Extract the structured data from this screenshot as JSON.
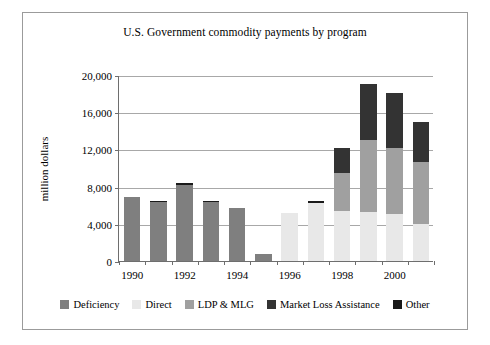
{
  "chart_data": {
    "type": "bar",
    "stacked": true,
    "title": "U.S. Government commodity payments by program",
    "xlabel": "",
    "ylabel": "million dollars",
    "ylim": [
      0,
      20000
    ],
    "ytick_step": 4000,
    "ytick_labels": [
      "20,000",
      "16,000",
      "12,000",
      "8,000",
      "4,000",
      "0"
    ],
    "ytick_values": [
      20000,
      16000,
      12000,
      8000,
      4000,
      0
    ],
    "grid": "horizontal",
    "legend_position": "bottom",
    "categories": [
      1990,
      1991,
      1992,
      1993,
      1994,
      1995,
      1996,
      1997,
      1998,
      1999,
      2000,
      2001
    ],
    "xtick_labels": [
      "1990",
      "1992",
      "1994",
      "1996",
      "1998",
      "2000"
    ],
    "xtick_label_years": [
      1990,
      1992,
      1994,
      1996,
      1998,
      2000
    ],
    "series": [
      {
        "name": "Deficiency",
        "color": "#7f7f7f",
        "values": [
          6900,
          6300,
          8200,
          6300,
          5700,
          800,
          0,
          0,
          0,
          0,
          0,
          0
        ]
      },
      {
        "name": "Direct",
        "color": "#e8e8e8",
        "values": [
          0,
          0,
          0,
          0,
          0,
          0,
          5200,
          6200,
          5400,
          5300,
          5100,
          4000
        ]
      },
      {
        "name": "LDP & MLG",
        "color": "#a0a0a0",
        "values": [
          0,
          0,
          0,
          0,
          0,
          0,
          0,
          0,
          4100,
          7700,
          7000,
          6700
        ]
      },
      {
        "name": "Market Loss Assistance",
        "color": "#333333",
        "values": [
          0,
          0,
          0,
          0,
          0,
          0,
          0,
          0,
          2700,
          6000,
          6000,
          4200
        ]
      },
      {
        "name": "Other",
        "color": "#1a1a1a",
        "values": [
          0,
          150,
          150,
          150,
          0,
          0,
          0,
          250,
          0,
          0,
          0,
          0
        ]
      }
    ],
    "totals": [
      6900,
      6450,
      8350,
      6450,
      5700,
      800,
      5200,
      6450,
      12200,
      19000,
      18100,
      14900
    ]
  }
}
